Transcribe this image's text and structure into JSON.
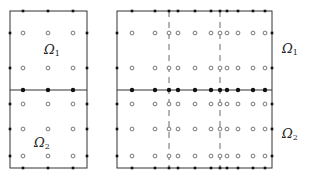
{
  "figure": {
    "width": 310,
    "height": 179,
    "colors": {
      "line": "#333333",
      "filled": "#111111",
      "open": "#555555",
      "dash": "#444444",
      "background": "#ffffff"
    }
  },
  "panels": [
    {
      "id": "left-mesh",
      "box": {
        "x0": 10,
        "x1": 87,
        "y0": 11,
        "y1": 168
      },
      "interface_y": 90,
      "dashed_x": [],
      "columns": [
        23,
        48,
        73
      ],
      "open_rows": [
        33,
        68,
        104,
        129,
        156
      ],
      "labels": [
        {
          "id": "omega1",
          "text": "Ω",
          "sub": "1",
          "x": 44,
          "y": 43
        },
        {
          "id": "omega2",
          "text": "Ω",
          "sub": "2",
          "x": 34,
          "y": 136
        }
      ]
    },
    {
      "id": "right-mesh",
      "box": {
        "x0": 117,
        "x1": 272,
        "y0": 11,
        "y1": 168
      },
      "interface_y": 90,
      "dashed_x": [
        169,
        220
      ],
      "columns": [
        132,
        155,
        169,
        178,
        195,
        211,
        220,
        227,
        238,
        253,
        265
      ],
      "open_rows": [
        33,
        68,
        104,
        129,
        156
      ],
      "labels": [
        {
          "id": "omega1",
          "text": "Ω",
          "sub": "1",
          "x": 282,
          "y": 42
        },
        {
          "id": "omega2",
          "text": "Ω",
          "sub": "2",
          "x": 282,
          "y": 127
        }
      ]
    }
  ],
  "legend_text": {
    "left_top": "Ω1",
    "left_bottom": "Ω2",
    "right_top": "Ω1",
    "right_bottom": "Ω2"
  }
}
